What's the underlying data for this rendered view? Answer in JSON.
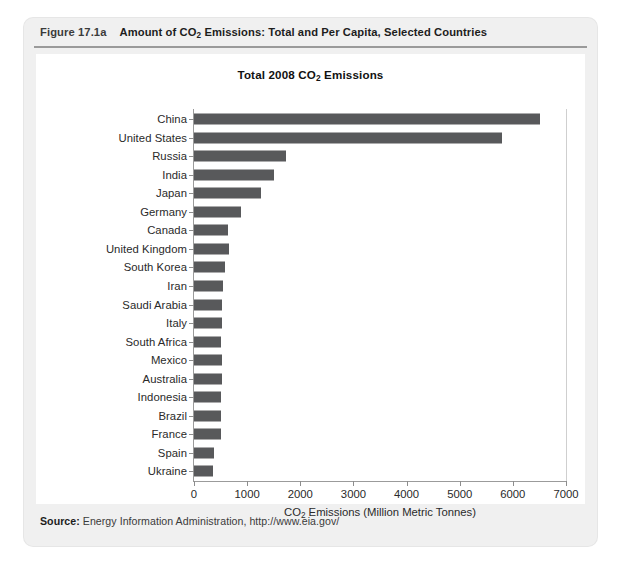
{
  "figure": {
    "number": "Figure 17.1a",
    "caption_pre": "Amount of CO",
    "caption_sub": "2",
    "caption_post": " Emissions: Total and Per Capita, Selected Countries",
    "source_label": "Source:",
    "source_text": " Energy Information Administration, http://www.eia.gov/"
  },
  "chart_data": {
    "type": "bar",
    "orientation": "horizontal",
    "title_pre": "Total 2008 CO",
    "title_sub": "2",
    "title_post": " Emissions",
    "title": "Total 2008 CO2 Emissions",
    "xlabel_pre": "CO",
    "xlabel_sub": "2",
    "xlabel_post": " Emissions (Million Metric Tonnes)",
    "xlabel": "CO2 Emissions (Million Metric Tonnes)",
    "ylabel": "",
    "xlim": [
      0,
      7000
    ],
    "xticks": [
      0,
      1000,
      2000,
      3000,
      4000,
      5000,
      6000,
      7000
    ],
    "xticklabels": [
      "0",
      "1000",
      "2000",
      "3000",
      "4000",
      "5000",
      "6000",
      "7000"
    ],
    "grid": false,
    "legend": null,
    "bar_color": "#58595b",
    "categories": [
      "China",
      "United States",
      "Russia",
      "India",
      "Japan",
      "Germany",
      "Canada",
      "United Kingdom",
      "South Korea",
      "Iran",
      "Saudi Arabia",
      "Italy",
      "South Africa",
      "Mexico",
      "Australia",
      "Indonesia",
      "Brazil",
      "France",
      "Spain",
      "Ukraine"
    ],
    "values": [
      6510,
      5800,
      1730,
      1500,
      1260,
      880,
      640,
      650,
      580,
      545,
      520,
      520,
      510,
      520,
      520,
      510,
      510,
      500,
      370,
      355
    ]
  }
}
